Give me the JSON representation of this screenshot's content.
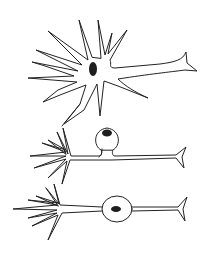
{
  "diagram": {
    "title": "",
    "background": "#ffffff",
    "stroke_color": "#222222",
    "nucleus_color": "#1e1e1e",
    "neurons": [
      {
        "type": "multipolar",
        "label": "",
        "soma_center": [
          94,
          70
        ],
        "nucleus_center": [
          93,
          69
        ]
      },
      {
        "type": "unipolar",
        "label": "",
        "soma_center": [
          107,
          140
        ],
        "nucleus_center": [
          107,
          133
        ]
      },
      {
        "type": "bipolar",
        "label": "",
        "soma_center": [
          117,
          209
        ],
        "nucleus_center": [
          116,
          209
        ]
      }
    ]
  }
}
